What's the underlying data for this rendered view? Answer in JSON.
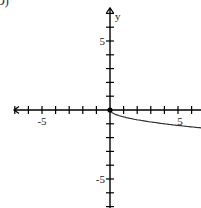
{
  "corner_label": "D)",
  "chart_data": {
    "type": "line",
    "title": "",
    "xlabel": "",
    "ylabel": "y",
    "xlim": [
      -8,
      7
    ],
    "ylim": [
      -7,
      8
    ],
    "x_tick_labels": [
      "-5",
      "5"
    ],
    "y_tick_labels": [
      "5",
      "-5"
    ],
    "x_ticks": [
      -7,
      -6,
      -5,
      -4,
      -3,
      -2,
      -1,
      1,
      2,
      3,
      4,
      5,
      6,
      7
    ],
    "y_ticks": [
      -7,
      -6,
      -5,
      -4,
      -3,
      -2,
      -1,
      1,
      2,
      3,
      4,
      5,
      6,
      7
    ],
    "grid": false,
    "series": [
      {
        "name": "f(x)",
        "start_point": {
          "x": 0,
          "y": 0,
          "filled": true
        },
        "x": [
          0,
          0.25,
          0.5,
          1,
          2,
          3,
          4,
          5,
          6,
          7
        ],
        "y": [
          0,
          -0.25,
          -0.35,
          -0.5,
          -0.71,
          -0.87,
          -1.0,
          -1.12,
          -1.22,
          -1.32
        ]
      }
    ],
    "colors": {
      "axis": "#000000",
      "curve": "#333333"
    }
  }
}
